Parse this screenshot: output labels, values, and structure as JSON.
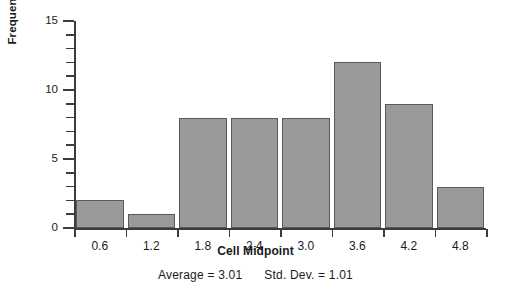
{
  "chart_data": {
    "type": "bar",
    "title": "",
    "subtitle": "",
    "xlabel": "Cell Midpoint",
    "ylabel": "Frequency",
    "categories": [
      "0.6",
      "1.2",
      "1.8",
      "2.4",
      "3.0",
      "3.6",
      "4.2",
      "4.8"
    ],
    "values": [
      2,
      1,
      8,
      8,
      8,
      12,
      9,
      3
    ],
    "ylim": [
      0,
      15
    ],
    "ytick_labels": [
      "0",
      "5",
      "10",
      "15"
    ],
    "ytick_values": [
      0,
      5,
      10,
      15
    ],
    "yminor_step": 1,
    "grid": false,
    "legend": null,
    "bar_fill": "#9a9a9a",
    "bar_border": "#5a5a5a",
    "axis_color": "#3c3c3c",
    "annotations": {
      "average_label": "Average  =  3.01",
      "stddev_label": "Std. Dev.  =  1.01",
      "average_value": 3.01,
      "stddev_value": 1.01
    }
  }
}
